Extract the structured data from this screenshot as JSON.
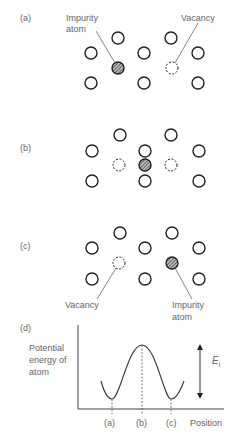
{
  "panels": {
    "a": {
      "label": "(a)",
      "impurity_label_line1": "Impurity",
      "impurity_label_line2": "atom",
      "vacancy_label": "Vacancy"
    },
    "b": {
      "label": "(b)"
    },
    "c": {
      "label": "(c)",
      "vacancy_label": "Vacancy",
      "impurity_label_line1": "Impurity",
      "impurity_label_line2": "atom"
    },
    "d": {
      "label": "(d)",
      "ylabel_line1": "Potential",
      "ylabel_line2": "energy of",
      "ylabel_line3": "atom",
      "xlabel": "Position",
      "energy_label": "E",
      "energy_subscript": "i",
      "ticks": [
        "(a)",
        "(b)",
        "(c)"
      ]
    }
  },
  "colors": {
    "atom_stroke": "#222222",
    "impurity_fill": "#888888",
    "line": "#555555",
    "text": "#666666"
  }
}
